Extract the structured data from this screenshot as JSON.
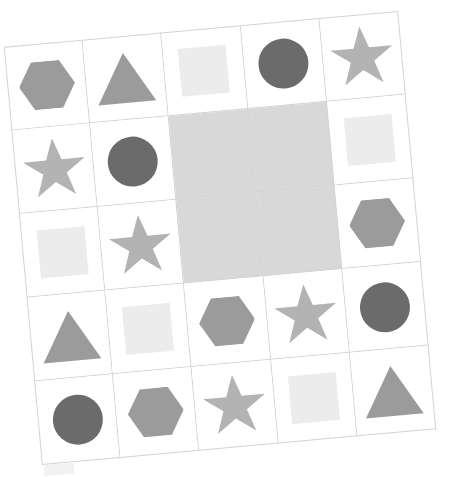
{
  "scene": {
    "kind": "abstract-reasoning-matrix",
    "background_color": "#ffffff",
    "grid": {
      "rows": 5,
      "columns": 5,
      "line_color": "#d2d2d2",
      "cell_background": "#ffffff",
      "masked_cell_color": "#d8d8d8",
      "rotation_degrees": -5.2
    },
    "palette": {
      "dark_gray": "#6b6b6b",
      "medium_gray": "#9b9b9b",
      "light_gray": "#b3b3b3",
      "very_light_gray": "#ececec",
      "mask_gray": "#d8d8d8",
      "line_gray": "#d2d2d2"
    },
    "ghost_fragment": {
      "present": true,
      "color": "#f2f2f2",
      "label": "partial-square-fragment"
    }
  },
  "cells": [
    {
      "id": "r1c1",
      "row": 1,
      "col": 1,
      "shape": "hexagon",
      "color": "#9b9b9b",
      "masked": false
    },
    {
      "id": "r1c2",
      "row": 1,
      "col": 2,
      "shape": "triangle",
      "color": "#9b9b9b",
      "masked": false
    },
    {
      "id": "r1c3",
      "row": 1,
      "col": 3,
      "shape": "square",
      "color": "#ececec",
      "masked": false
    },
    {
      "id": "r1c4",
      "row": 1,
      "col": 4,
      "shape": "circle",
      "color": "#6b6b6b",
      "masked": false
    },
    {
      "id": "r1c5",
      "row": 1,
      "col": 5,
      "shape": "star",
      "color": "#b3b3b3",
      "masked": false
    },
    {
      "id": "r2c1",
      "row": 2,
      "col": 1,
      "shape": "star",
      "color": "#b3b3b3",
      "masked": false
    },
    {
      "id": "r2c2",
      "row": 2,
      "col": 2,
      "shape": "circle",
      "color": "#6b6b6b",
      "masked": false
    },
    {
      "id": "r2c3",
      "row": 2,
      "col": 3,
      "shape": "none",
      "color": "#d8d8d8",
      "masked": true
    },
    {
      "id": "r2c4",
      "row": 2,
      "col": 4,
      "shape": "none",
      "color": "#d8d8d8",
      "masked": true
    },
    {
      "id": "r2c5",
      "row": 2,
      "col": 5,
      "shape": "square",
      "color": "#ececec",
      "masked": false
    },
    {
      "id": "r3c1",
      "row": 3,
      "col": 1,
      "shape": "square",
      "color": "#ececec",
      "masked": false
    },
    {
      "id": "r3c2",
      "row": 3,
      "col": 2,
      "shape": "star",
      "color": "#b3b3b3",
      "masked": false
    },
    {
      "id": "r3c3",
      "row": 3,
      "col": 3,
      "shape": "none",
      "color": "#d8d8d8",
      "masked": true
    },
    {
      "id": "r3c4",
      "row": 3,
      "col": 4,
      "shape": "none",
      "color": "#d8d8d8",
      "masked": true
    },
    {
      "id": "r3c5",
      "row": 3,
      "col": 5,
      "shape": "hexagon",
      "color": "#9b9b9b",
      "masked": false
    },
    {
      "id": "r4c1",
      "row": 4,
      "col": 1,
      "shape": "triangle",
      "color": "#9b9b9b",
      "masked": false
    },
    {
      "id": "r4c2",
      "row": 4,
      "col": 2,
      "shape": "square",
      "color": "#ececec",
      "masked": false
    },
    {
      "id": "r4c3",
      "row": 4,
      "col": 3,
      "shape": "hexagon",
      "color": "#9b9b9b",
      "masked": false
    },
    {
      "id": "r4c4",
      "row": 4,
      "col": 4,
      "shape": "star",
      "color": "#b3b3b3",
      "masked": false
    },
    {
      "id": "r4c5",
      "row": 4,
      "col": 5,
      "shape": "circle",
      "color": "#6b6b6b",
      "masked": false
    },
    {
      "id": "r5c1",
      "row": 5,
      "col": 1,
      "shape": "circle",
      "color": "#6b6b6b",
      "masked": false
    },
    {
      "id": "r5c2",
      "row": 5,
      "col": 2,
      "shape": "hexagon",
      "color": "#9b9b9b",
      "masked": false
    },
    {
      "id": "r5c3",
      "row": 5,
      "col": 3,
      "shape": "star",
      "color": "#b3b3b3",
      "masked": false
    },
    {
      "id": "r5c4",
      "row": 5,
      "col": 4,
      "shape": "square",
      "color": "#ececec",
      "masked": false
    },
    {
      "id": "r5c5",
      "row": 5,
      "col": 5,
      "shape": "triangle",
      "color": "#9b9b9b",
      "masked": false
    }
  ]
}
